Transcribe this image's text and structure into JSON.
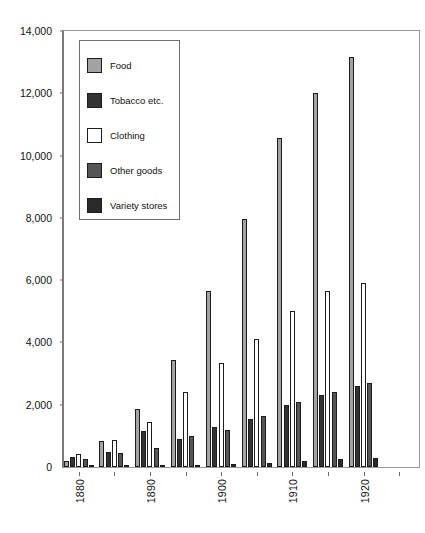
{
  "chart_data": {
    "type": "bar",
    "title": "",
    "subtitle": "",
    "xlabel": "",
    "ylabel": "",
    "grid": false,
    "legend_position": "inside-top-left",
    "ylim": [
      0,
      14000
    ],
    "ytick_values": [
      0,
      2000,
      4000,
      6000,
      8000,
      10000,
      12000,
      14000
    ],
    "ytick_labels": [
      "0",
      "2,000",
      "4,000",
      "6,000",
      "8,000",
      "10,000",
      "12,000",
      "14,000"
    ],
    "categories": [
      "1880",
      "1885",
      "1890",
      "1895",
      "1900",
      "1905",
      "1910",
      "1915",
      "1920",
      "1925"
    ],
    "xtick_labels_shown": [
      "1880",
      "1890",
      "1900",
      "1910",
      "1920"
    ],
    "series": [
      {
        "name": "Food",
        "color": "#a3a3a3",
        "values": [
          200,
          850,
          1850,
          3450,
          5650,
          7950,
          10550,
          12000,
          13150,
          0
        ]
      },
      {
        "name": "Tobacco etc.",
        "color": "#333333",
        "values": [
          330,
          480,
          1150,
          900,
          1300,
          1550,
          2000,
          2300,
          2600,
          0
        ]
      },
      {
        "name": "Clothing",
        "color": "#ffffff",
        "values": [
          420,
          880,
          1450,
          2400,
          3350,
          4100,
          5000,
          5650,
          5900,
          0
        ]
      },
      {
        "name": "Other goods",
        "color": "#555555",
        "values": [
          250,
          450,
          620,
          1000,
          1200,
          1650,
          2100,
          2400,
          2700,
          0
        ]
      },
      {
        "name": "Variety stores",
        "color": "#2a2a2a",
        "values": [
          30,
          40,
          50,
          60,
          90,
          120,
          180,
          250,
          280,
          0
        ]
      }
    ]
  },
  "legend": {
    "items": [
      {
        "label": "Food"
      },
      {
        "label": "Tobacco etc."
      },
      {
        "label": "Clothing"
      },
      {
        "label": "Other goods"
      },
      {
        "label": "Variety stores"
      }
    ]
  }
}
